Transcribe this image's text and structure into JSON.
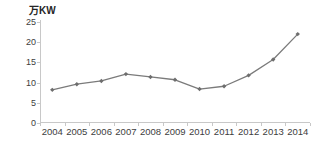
{
  "chart_data": {
    "type": "line",
    "title": "",
    "subtitle": "",
    "xlabel": "",
    "ylabel": "万KW",
    "unit_label": "万KW",
    "categories": [
      "2004",
      "2005",
      "2006",
      "2007",
      "2008",
      "2009",
      "2010",
      "2011",
      "2012",
      "2013",
      "2014"
    ],
    "values": [
      8.2,
      9.6,
      10.4,
      12.1,
      11.4,
      10.7,
      8.4,
      9.1,
      11.8,
      15.7,
      22.0
    ],
    "series": [
      {
        "name": "",
        "values": [
          8.2,
          9.6,
          10.4,
          12.1,
          11.4,
          10.7,
          8.4,
          9.1,
          11.8,
          15.7,
          22.0
        ]
      }
    ],
    "ylim": [
      0,
      25
    ],
    "ytick_labels": [
      "0",
      "5",
      "10",
      "15",
      "20",
      "25"
    ],
    "ytick_values": [
      0,
      5,
      10,
      15,
      20,
      25
    ],
    "grid": false,
    "legend": false,
    "legend_position": "none",
    "marker": "diamond",
    "colors": {
      "line": "#7b7b7b",
      "marker": "#6e6e6e",
      "axis": "#c8c8c8",
      "text": "#3d3d3d",
      "unit_text": "#262626",
      "background": "#ffffff"
    }
  }
}
